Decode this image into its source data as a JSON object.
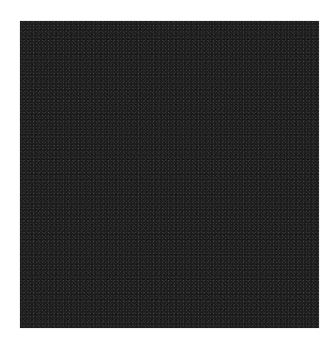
{
  "image": {
    "description": "Dark noisy square on white background",
    "background_color": "#ffffff",
    "square": {
      "color": "#1c1c1c",
      "texture": "fine grain noise",
      "x": 20,
      "y": 21,
      "width": 299,
      "height": 307
    }
  }
}
